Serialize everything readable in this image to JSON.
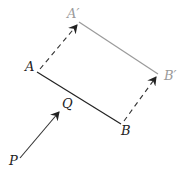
{
  "diagram": {
    "colors": {
      "original": "#222222",
      "image": "#9a9a9a",
      "vector": "#333333",
      "background": "#ffffff"
    },
    "points": {
      "A": {
        "label": "A",
        "x": 37,
        "y": 72
      },
      "B": {
        "label": "B",
        "x": 121,
        "y": 124
      },
      "A_prime": {
        "label": "A′",
        "x": 79,
        "y": 22
      },
      "B_prime": {
        "label": "B′",
        "x": 158,
        "y": 74
      },
      "P": {
        "label": "P",
        "x": 20,
        "y": 158
      },
      "Q": {
        "label": "Q",
        "x": 60,
        "y": 111
      }
    },
    "segments": [
      {
        "name": "segment-AB",
        "from": "A",
        "to": "B",
        "style": "solid"
      },
      {
        "name": "segment-A-prime-B-prime",
        "from": "A_prime",
        "to": "B_prime",
        "style": "solid"
      }
    ],
    "arrows": [
      {
        "name": "vector-PQ",
        "from": "P",
        "to": "Q",
        "style": "solid"
      },
      {
        "name": "translation-A-to-A-prime",
        "from": "A",
        "to": "A_prime",
        "style": "dashed"
      },
      {
        "name": "translation-B-to-B-prime",
        "from": "B",
        "to": "B_prime",
        "style": "dashed"
      }
    ]
  }
}
